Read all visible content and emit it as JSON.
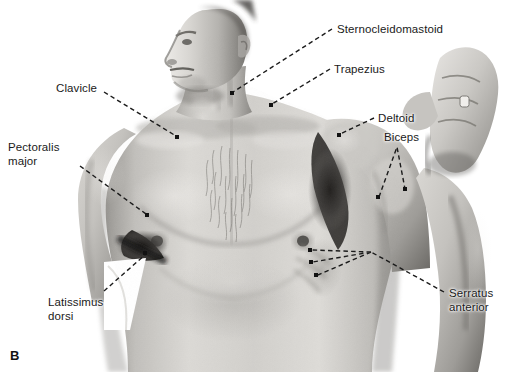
{
  "figure": {
    "panel_letter": "B",
    "caption_view": "anterior view of male torso, left arm raised",
    "background_color": "#ffffff",
    "image_kind": "black-and-white anatomical photograph",
    "width": 505,
    "height": 372
  },
  "annotations": [
    {
      "id": "clavicle",
      "label": "Clavicle",
      "label_x": 56,
      "label_y": 82,
      "anchor_side": "left",
      "leader": "M 104 92 L 176 136",
      "dot_x": 177,
      "dot_y": 137
    },
    {
      "id": "pectoralis-major",
      "label": "Pectoralis\nmajor",
      "label_x": 8,
      "label_y": 141,
      "anchor_side": "left",
      "leader": "M 80 166 L 146 214",
      "dot_x": 147,
      "dot_y": 215
    },
    {
      "id": "latissimus-dorsi",
      "label": "Latissimus\ndorsi",
      "label_x": 48,
      "label_y": 296,
      "anchor_side": "left",
      "leader": "M 104 291 L 146 254",
      "dot_x": 145,
      "dot_y": 253
    },
    {
      "id": "sternocleidomastoid",
      "label": "Sternocleidomastoid",
      "label_x": 337,
      "label_y": 23,
      "anchor_side": "right",
      "leader": "M 332 29 L 233 92",
      "dot_x": 232,
      "dot_y": 93
    },
    {
      "id": "trapezius",
      "label": "Trapezius",
      "label_x": 334,
      "label_y": 63,
      "anchor_side": "right",
      "leader": "M 330 69 L 272 104",
      "dot_x": 271,
      "dot_y": 105
    },
    {
      "id": "deltoid",
      "label": "Deltoid",
      "label_x": 378,
      "label_y": 112,
      "anchor_side": "right",
      "leader": "M 374 118 L 340 134",
      "dot_x": 339,
      "dot_y": 135
    },
    {
      "id": "biceps",
      "label": "Biceps",
      "label_x": 384,
      "label_y": 131,
      "anchor_side": "right",
      "leader": "M 379 197 L 397 147 L 405 189",
      "dot_x": 378,
      "dot_y": 197,
      "dot2_x": 405,
      "dot2_y": 189
    },
    {
      "id": "serratus-anterior",
      "label": "Serratus\nanterior",
      "label_x": 449,
      "label_y": 287,
      "anchor_side": "right",
      "leader": "M 444 292 L 371 252 M 371 252 L 312 250 M 371 252 L 313 262 M 371 252 L 318 275",
      "dot_x": 310,
      "dot_y": 250,
      "dot2_x": 311,
      "dot2_y": 262,
      "dot3_x": 316,
      "dot3_y": 275
    }
  ],
  "colors": {
    "label_text": "#1a1a1a",
    "leader_line": "#1b1b1b",
    "photo_light": "#e2e0dd",
    "photo_mid": "#bcbab6",
    "photo_dark": "#6e6b67",
    "photo_shadow": "#2a2826"
  }
}
